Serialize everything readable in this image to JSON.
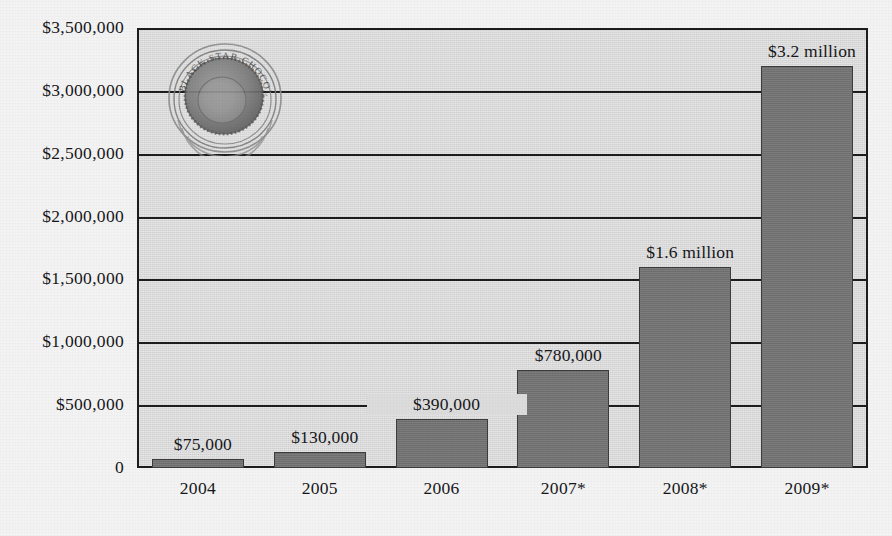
{
  "chart_data": {
    "type": "bar",
    "title": "",
    "subtitle": "",
    "xlabel": "",
    "ylabel": "",
    "categories": [
      "2004",
      "2005",
      "2006",
      "2007*",
      "2008*",
      "2009*"
    ],
    "values": [
      75000,
      130000,
      390000,
      780000,
      1600000,
      3200000
    ],
    "data_labels": [
      "$75,000",
      "$130,000",
      "$390,000",
      "$780,000",
      "$1.6 million",
      "$3.2 million"
    ],
    "ylim": [
      0,
      3500000
    ],
    "ytick_values": [
      3500000,
      3000000,
      2500000,
      2000000,
      1500000,
      1000000,
      500000,
      0
    ],
    "ytick_labels": [
      "$3,500,000",
      "$3,000,000",
      "$2,500,000",
      "$2,000,000",
      "$1,500,000",
      "$1,000,000",
      "$500,000",
      "0"
    ],
    "grid": true,
    "gridlines_at": [
      3500000,
      3000000,
      2500000,
      2000000,
      1500000,
      1000000,
      500000
    ],
    "legend": [],
    "legend_position": "none",
    "annotations": [
      {
        "name": "projection-asterisk",
        "text": "*",
        "note": "appended to 2007, 2008 and 2009 category labels"
      }
    ],
    "series": [
      {
        "name": "Annual figures",
        "values": [
          75000,
          130000,
          390000,
          780000,
          1600000,
          3200000
        ]
      }
    ]
  },
  "colors": {
    "page_background": "#f3f3f3",
    "plot_background": "#d9d9d9",
    "bar_fill": "#757575",
    "bar_border": "#3c3c3c",
    "axis_line": "#1d1d1d",
    "gridline": "#1d1d1d",
    "text": "#17171a"
  },
  "watermark": {
    "name": "circular-ring-logo",
    "description": "circular embossed logo with concentric rings and curved text"
  }
}
